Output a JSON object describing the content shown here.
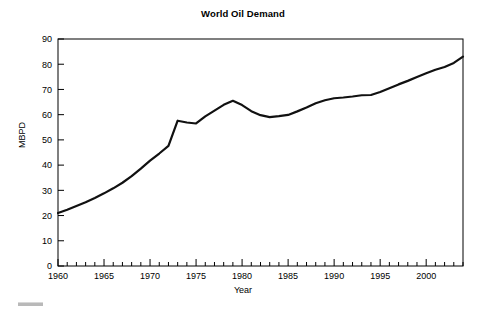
{
  "chart_data": {
    "type": "line",
    "title": "World Oil Demand",
    "xlabel": "Year",
    "ylabel": "MBPD",
    "xlim": [
      1960,
      2004
    ],
    "ylim": [
      0,
      90
    ],
    "grid": false,
    "legend": "none",
    "x_major_ticks": [
      1960,
      1965,
      1970,
      1975,
      1980,
      1985,
      1990,
      1995,
      2000
    ],
    "x_major_tick_labels": [
      "1960",
      "1965",
      "1970",
      "1975",
      "1980",
      "1985",
      "1990",
      "1995",
      "2000"
    ],
    "x_minor_tick_interval": 1,
    "y_major_ticks": [
      0,
      10,
      20,
      30,
      40,
      50,
      60,
      70,
      80,
      90
    ],
    "y_major_tick_labels": [
      "0",
      "10",
      "20",
      "30",
      "40",
      "50",
      "60",
      "70",
      "80",
      "90"
    ],
    "series": [
      {
        "name": "World Oil Demand",
        "color": "#111111",
        "line_width": 2.2,
        "x": [
          1960,
          1961,
          1962,
          1963,
          1964,
          1965,
          1966,
          1967,
          1968,
          1969,
          1970,
          1971,
          1972,
          1973,
          1974,
          1975,
          1976,
          1977,
          1978,
          1979,
          1980,
          1981,
          1982,
          1983,
          1984,
          1985,
          1986,
          1987,
          1988,
          1989,
          1990,
          1991,
          1992,
          1993,
          1994,
          1995,
          1996,
          1997,
          1998,
          1999,
          2000,
          2001,
          2002,
          2003,
          2004
        ],
        "values": [
          21.0,
          22.3,
          23.8,
          25.3,
          27.0,
          28.8,
          30.8,
          33.0,
          35.6,
          38.6,
          41.8,
          44.6,
          47.6,
          57.6,
          56.9,
          56.5,
          59.3,
          61.6,
          63.9,
          65.5,
          63.8,
          61.4,
          59.8,
          59.0,
          59.4,
          59.9,
          61.3,
          62.8,
          64.5,
          65.7,
          66.5,
          66.8,
          67.2,
          67.7,
          67.8,
          69.0,
          70.5,
          72.0,
          73.4,
          74.9,
          76.4,
          77.8,
          78.9,
          80.5,
          83.0
        ]
      }
    ]
  },
  "figure": {
    "axis_color": "#000000",
    "background_color": "#ffffff"
  }
}
